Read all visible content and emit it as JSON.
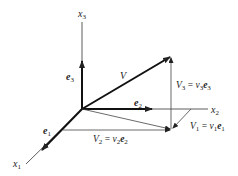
{
  "diagram": {
    "axes": {
      "x1": {
        "label": "x",
        "sub": "1"
      },
      "x2": {
        "label": "x",
        "sub": "2"
      },
      "x3": {
        "label": "x",
        "sub": "3"
      }
    },
    "unit_vectors": {
      "e1": {
        "label": "e",
        "sub": "1"
      },
      "e2": {
        "label": "e",
        "sub": "2"
      },
      "e3": {
        "label": "e",
        "sub": "3"
      }
    },
    "vector": {
      "label": "V"
    },
    "components": {
      "V1": {
        "lhs": "V",
        "lhs_sub": "1",
        "eq": " = ",
        "coef": "v",
        "coef_sub": "1",
        "basis": "e",
        "basis_sub": "1"
      },
      "V2": {
        "lhs": "V",
        "lhs_sub": "2",
        "eq": " = ",
        "coef": "v",
        "coef_sub": "2",
        "basis": "e",
        "basis_sub": "2"
      },
      "V3": {
        "lhs": "V",
        "lhs_sub": "3",
        "eq": " = ",
        "coef": "v",
        "coef_sub": "3",
        "basis": "e",
        "basis_sub": "3"
      }
    },
    "colors": {
      "line": "#222222",
      "background": "#ffffff"
    }
  }
}
